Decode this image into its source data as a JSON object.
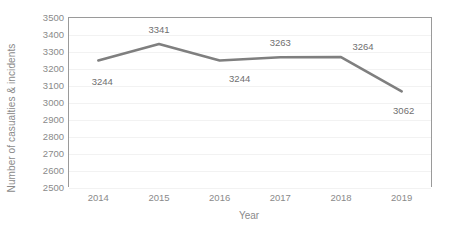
{
  "chart_data": {
    "type": "line",
    "title": "",
    "xlabel": "Year",
    "ylabel": "Number of casualties & incidents",
    "categories": [
      "2014",
      "2015",
      "2016",
      "2017",
      "2018",
      "2019"
    ],
    "values": [
      3244,
      3341,
      3244,
      3263,
      3264,
      3062
    ],
    "data_labels": [
      "3244",
      "3341",
      "3244",
      "3263",
      "3264",
      "3062"
    ],
    "series": [
      {
        "name": "Casualties & incidents",
        "values": [
          3244,
          3341,
          3244,
          3263,
          3264,
          3062
        ],
        "color": "#7f7f7f"
      }
    ],
    "ylim": [
      2500,
      3500
    ],
    "ytick_step": 100,
    "ytick_labels": [
      "3500",
      "3400",
      "3300",
      "3200",
      "3100",
      "3000",
      "2900",
      "2800",
      "2700",
      "2600",
      "2500"
    ],
    "ytick_values": [
      3500,
      3400,
      3300,
      3200,
      3100,
      3000,
      2900,
      2800,
      2700,
      2600,
      2500
    ],
    "xtick_labels": [
      "2014",
      "2015",
      "2016",
      "2017",
      "2018",
      "2019"
    ],
    "grid": true,
    "grid_color": "#f2f2f2",
    "legend": false,
    "legend_position": "none",
    "markers": false,
    "axis_color": "#9a9a9a",
    "text_color": "#8a8a8a",
    "label_placement": [
      "below",
      "above",
      "below",
      "above",
      "above",
      "below"
    ]
  }
}
